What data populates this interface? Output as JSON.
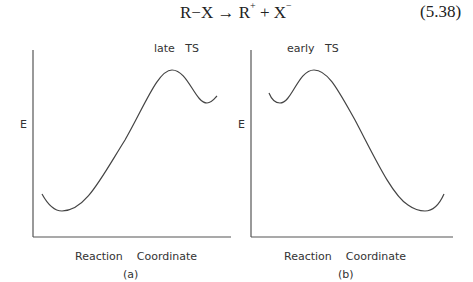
{
  "equation": {
    "reactant": "R−X",
    "arrow": "→",
    "product1": "R",
    "product1_charge": "+",
    "plus": "+",
    "product2": "X",
    "product2_charge": "−",
    "number": "(5.38)"
  },
  "panels": [
    {
      "id": "a",
      "caption": "(a)",
      "annotation": "late   TS",
      "ylabel": "E",
      "xlabel": "Reaction    Coordinate",
      "description": "Endothermic: reactant low, product high; transition state near product"
    },
    {
      "id": "b",
      "caption": "(b)",
      "annotation": "early   TS",
      "ylabel": "E",
      "xlabel": "Reaction    Coordinate",
      "description": "Exothermic: reactant high, product low; transition state near reactant"
    }
  ],
  "colors": {
    "line": "#444444",
    "text": "#333333"
  }
}
